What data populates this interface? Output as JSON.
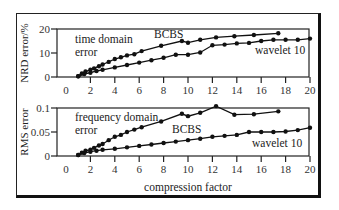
{
  "chart_data": [
    {
      "type": "line",
      "title": "",
      "annotation": "time domain error",
      "annotation_lines": [
        "time domain",
        "error"
      ],
      "xlabel": "",
      "ylabel": "NRD error/%",
      "xlim": [
        0,
        20
      ],
      "ylim": [
        0,
        20
      ],
      "xticks": [
        0,
        2,
        4,
        6,
        8,
        10,
        12,
        14,
        16,
        18,
        20
      ],
      "yticks": [
        0,
        10,
        20
      ],
      "ytick_labels": [
        "0",
        "10",
        "20"
      ],
      "grid": false,
      "series": [
        {
          "name": "BCBS",
          "x": [
            1.0,
            1.3,
            1.6,
            2.0,
            2.3,
            2.7,
            3.0,
            3.5,
            4.0,
            4.5,
            5.0,
            5.6,
            6.2,
            7.8,
            9.5,
            10.0,
            11.0,
            12.3,
            13.8,
            15.4,
            17.4
          ],
          "y": [
            0.3,
            1.5,
            2.3,
            3.0,
            3.6,
            4.5,
            5.2,
            6.3,
            7.5,
            8.2,
            9.0,
            9.5,
            10.8,
            13.0,
            15.0,
            14.3,
            15.5,
            16.5,
            17.0,
            17.5,
            18.2
          ]
        },
        {
          "name": "wavelet 10",
          "x": [
            1.0,
            1.5,
            2.0,
            2.5,
            3.0,
            4.0,
            5.0,
            6.0,
            7.0,
            8.0,
            9.0,
            10.0,
            11.0,
            12.0,
            13.0,
            14.0,
            15.0,
            16.0,
            17.0,
            18.0,
            19.0,
            20.0
          ],
          "y": [
            0.3,
            1.2,
            1.8,
            2.5,
            3.0,
            4.0,
            5.0,
            6.0,
            7.0,
            8.0,
            9.3,
            9.3,
            10.2,
            13.2,
            13.5,
            14.0,
            14.2,
            15.0,
            15.5,
            15.5,
            15.5,
            16.0
          ]
        }
      ]
    },
    {
      "type": "line",
      "title": "",
      "annotation": "frequency domain error",
      "annotation_lines": [
        "frequency domain",
        "error"
      ],
      "xlabel": "compression factor",
      "ylabel": "RMS error",
      "xlim": [
        0,
        20
      ],
      "ylim": [
        0,
        0.1
      ],
      "xticks": [
        0,
        2,
        4,
        6,
        8,
        10,
        12,
        14,
        16,
        18,
        20
      ],
      "yticks": [
        0,
        0.05,
        0.1
      ],
      "ytick_labels": [
        "0",
        "0.05",
        "0.1"
      ],
      "grid": false,
      "series": [
        {
          "name": "BCBS",
          "x": [
            1.0,
            1.3,
            1.6,
            2.0,
            2.3,
            2.7,
            3.0,
            3.5,
            4.0,
            4.5,
            5.0,
            5.6,
            6.2,
            7.8,
            9.5,
            10.0,
            11.0,
            12.3,
            13.8,
            15.4,
            17.4
          ],
          "y": [
            0.002,
            0.007,
            0.011,
            0.013,
            0.017,
            0.022,
            0.025,
            0.033,
            0.04,
            0.044,
            0.05,
            0.055,
            0.06,
            0.072,
            0.088,
            0.083,
            0.09,
            0.104,
            0.086,
            0.087,
            0.093
          ]
        },
        {
          "name": "wavelet 10",
          "x": [
            1.0,
            1.5,
            2.0,
            2.5,
            3.0,
            4.0,
            5.0,
            6.0,
            7.0,
            8.0,
            9.0,
            10.0,
            11.0,
            12.0,
            13.0,
            14.0,
            15.0,
            16.0,
            17.0,
            18.0,
            19.0,
            20.0
          ],
          "y": [
            0.002,
            0.006,
            0.009,
            0.011,
            0.013,
            0.015,
            0.018,
            0.021,
            0.024,
            0.027,
            0.03,
            0.033,
            0.036,
            0.04,
            0.042,
            0.044,
            0.05,
            0.05,
            0.05,
            0.051,
            0.054,
            0.059
          ]
        }
      ]
    }
  ],
  "labels": {
    "top_bcbs": "BCBS",
    "top_wavelet": "wavelet 10",
    "bottom_bcbs": "BCBS",
    "bottom_wavelet": "wavelet 10"
  }
}
